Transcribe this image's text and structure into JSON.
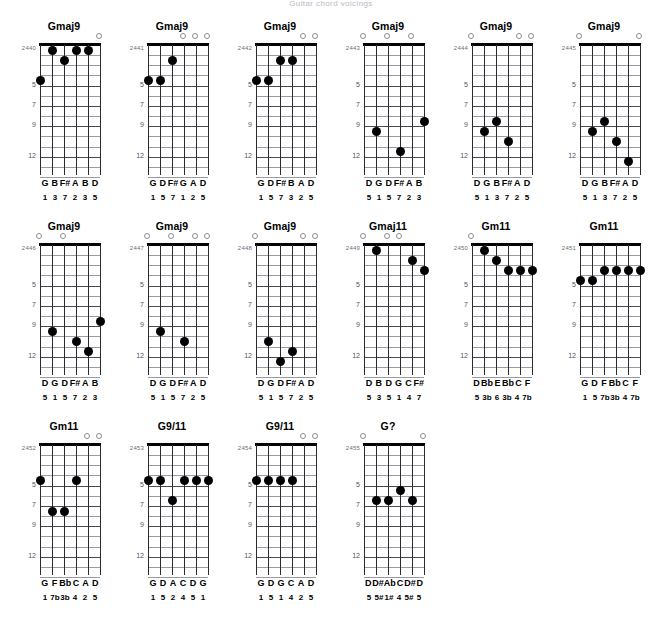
{
  "page": {
    "title": "Guitar chord voicings",
    "fret_labels": [
      "5",
      "7",
      "9",
      "12"
    ],
    "fret_label_rows": [
      4,
      6,
      8,
      11
    ],
    "num_frets": 13,
    "num_strings": 6
  },
  "chords": [
    {
      "id": "2440",
      "name": "Gmaj9",
      "open": [
        6
      ],
      "dots": [
        [
          1,
          4,
          1
        ],
        [
          2,
          1,
          3
        ],
        [
          3,
          2,
          7
        ],
        [
          4,
          1,
          2
        ],
        [
          5,
          1,
          3
        ]
      ],
      "notes": [
        "G",
        "B",
        "F#",
        "A",
        "B",
        "D"
      ],
      "degrees": [
        "1",
        "3",
        "7",
        "2",
        "3",
        "5"
      ]
    },
    {
      "id": "2441",
      "name": "Gmaj9",
      "open": [
        4,
        5,
        6
      ],
      "dots": [
        [
          1,
          4,
          1
        ],
        [
          2,
          4,
          5
        ],
        [
          3,
          2,
          7
        ]
      ],
      "notes": [
        "G",
        "D",
        "F#",
        "G",
        "A",
        "D"
      ],
      "degrees": [
        "1",
        "5",
        "7",
        "1",
        "2",
        "5"
      ]
    },
    {
      "id": "2442",
      "name": "Gmaj9",
      "open": [
        5,
        6
      ],
      "dots": [
        [
          1,
          4,
          1
        ],
        [
          2,
          4,
          5
        ],
        [
          3,
          2,
          7
        ],
        [
          4,
          2,
          3
        ]
      ],
      "notes": [
        "G",
        "D",
        "F#",
        "B",
        "A",
        "D"
      ],
      "degrees": [
        "1",
        "5",
        "7",
        "3",
        "2",
        "5"
      ]
    },
    {
      "id": "2443",
      "name": "Gmaj9",
      "open": [
        1,
        3,
        5
      ],
      "dots": [
        [
          2,
          9,
          1
        ],
        [
          4,
          11,
          7
        ],
        [
          6,
          8,
          3
        ]
      ],
      "notes": [
        "D",
        "G",
        "D",
        "F#",
        "A",
        "B"
      ],
      "degrees": [
        "5",
        "1",
        "5",
        "7",
        "2",
        "3"
      ]
    },
    {
      "id": "2444",
      "name": "Gmaj9",
      "open": [
        1,
        5,
        6
      ],
      "dots": [
        [
          2,
          9,
          1
        ],
        [
          3,
          8,
          3
        ],
        [
          4,
          10,
          7
        ]
      ],
      "notes": [
        "D",
        "G",
        "B",
        "F#",
        "A",
        "D"
      ],
      "degrees": [
        "5",
        "1",
        "3",
        "7",
        "2",
        "5"
      ]
    },
    {
      "id": "2445",
      "name": "Gmaj9",
      "open": [
        1,
        6
      ],
      "dots": [
        [
          2,
          9,
          1
        ],
        [
          3,
          8,
          3
        ],
        [
          4,
          10,
          7
        ],
        [
          5,
          12,
          2
        ]
      ],
      "notes": [
        "D",
        "G",
        "B",
        "F#",
        "A",
        "D"
      ],
      "degrees": [
        "5",
        "1",
        "3",
        "7",
        "2",
        "5"
      ]
    },
    {
      "id": "2446",
      "name": "Gmaj9",
      "open": [
        1,
        3
      ],
      "dots": [
        [
          2,
          9,
          1
        ],
        [
          4,
          10,
          7
        ],
        [
          5,
          11,
          2
        ],
        [
          6,
          8,
          3
        ]
      ],
      "notes": [
        "D",
        "G",
        "D",
        "F#",
        "A",
        "B"
      ],
      "degrees": [
        "5",
        "1",
        "5",
        "7",
        "2",
        "3"
      ]
    },
    {
      "id": "2447",
      "name": "Gmaj9",
      "open": [
        1,
        3,
        5,
        6
      ],
      "dots": [
        [
          2,
          9,
          1
        ],
        [
          4,
          10,
          7
        ]
      ],
      "notes": [
        "D",
        "G",
        "D",
        "F#",
        "A",
        "D"
      ],
      "degrees": [
        "5",
        "1",
        "5",
        "7",
        "2",
        "5"
      ]
    },
    {
      "id": "2448",
      "name": "Gmaj9",
      "open": [
        1,
        5,
        6
      ],
      "dots": [
        [
          2,
          10,
          1
        ],
        [
          3,
          12,
          5
        ],
        [
          4,
          11,
          7
        ]
      ],
      "notes": [
        "D",
        "G",
        "D",
        "F#",
        "A",
        "D"
      ],
      "degrees": [
        "5",
        "1",
        "5",
        "7",
        "2",
        "5"
      ]
    },
    {
      "id": "2449",
      "name": "Gmaj11",
      "open": [
        1,
        3,
        4
      ],
      "dots": [
        [
          2,
          1,
          3
        ],
        [
          5,
          2,
          4
        ],
        [
          6,
          3,
          7
        ]
      ],
      "notes": [
        "D",
        "B",
        "D",
        "G",
        "C",
        "F#"
      ],
      "degrees": [
        "5",
        "3",
        "5",
        "1",
        "4",
        "7"
      ]
    },
    {
      "id": "2450",
      "name": "Gm11",
      "open": [
        1
      ],
      "dots": [
        [
          2,
          1,
          3
        ],
        [
          3,
          2,
          6
        ],
        [
          4,
          3,
          3
        ],
        [
          5,
          3,
          4
        ],
        [
          6,
          3,
          7
        ]
      ],
      "notes": [
        "D",
        "Bb",
        "E",
        "Bb",
        "C",
        "F"
      ],
      "degrees": [
        "5",
        "3b",
        "6",
        "3b",
        "4",
        "7b"
      ]
    },
    {
      "id": "2451",
      "name": "Gm11",
      "open": [],
      "dots": [
        [
          1,
          4,
          1
        ],
        [
          2,
          4,
          5
        ],
        [
          3,
          3,
          7
        ],
        [
          4,
          3,
          3
        ],
        [
          5,
          3,
          4
        ],
        [
          6,
          3,
          7
        ]
      ],
      "notes": [
        "G",
        "D",
        "F",
        "Bb",
        "C",
        "F"
      ],
      "degrees": [
        "1",
        "5",
        "7b",
        "3b",
        "4",
        "7b"
      ]
    },
    {
      "id": "2452",
      "name": "Gm11",
      "open": [
        5,
        6
      ],
      "dots": [
        [
          1,
          4,
          1
        ],
        [
          2,
          7,
          7
        ],
        [
          3,
          7,
          3
        ],
        [
          4,
          4,
          4
        ]
      ],
      "notes": [
        "G",
        "F",
        "Bb",
        "C",
        "A",
        "D"
      ],
      "degrees": [
        "1",
        "7b",
        "3b",
        "4",
        "2",
        "5"
      ]
    },
    {
      "id": "2453",
      "name": "G9/11",
      "open": [],
      "dots": [
        [
          1,
          4,
          1
        ],
        [
          2,
          4,
          5
        ],
        [
          3,
          6,
          2
        ],
        [
          4,
          4,
          4
        ],
        [
          5,
          4,
          5
        ],
        [
          6,
          4,
          1
        ]
      ],
      "notes": [
        "G",
        "D",
        "A",
        "C",
        "D",
        "G"
      ],
      "degrees": [
        "1",
        "5",
        "2",
        "4",
        "5",
        "1"
      ]
    },
    {
      "id": "2454",
      "name": "G9/11",
      "open": [
        5,
        6
      ],
      "dots": [
        [
          1,
          4,
          1
        ],
        [
          2,
          4,
          5
        ],
        [
          3,
          4,
          1
        ],
        [
          4,
          4,
          4
        ]
      ],
      "notes": [
        "G",
        "D",
        "G",
        "C",
        "A",
        "D"
      ],
      "degrees": [
        "1",
        "5",
        "1",
        "4",
        "2",
        "5"
      ]
    },
    {
      "id": "2455",
      "name": "G?",
      "open": [
        1,
        6
      ],
      "dots": [
        [
          2,
          6,
          5
        ],
        [
          3,
          6,
          1
        ],
        [
          4,
          5,
          4
        ],
        [
          5,
          6,
          5
        ]
      ],
      "notes": [
        "D",
        "D#",
        "Ab",
        "C",
        "D#",
        "D"
      ],
      "degrees": [
        "5",
        "5#",
        "1#",
        "4",
        "5#",
        "5"
      ]
    }
  ],
  "chart_data": {
    "type": "table",
    "title": "Guitar chord voicings",
    "columns": [
      "id",
      "name",
      "open_strings",
      "fretted_dots",
      "notes",
      "degrees"
    ],
    "rows": [
      [
        "2440",
        "Gmaj9",
        "6",
        "s1f4 s2f1 s3f2 s4f1 s5f1",
        "G B F# A B D",
        "1 3 7 2 3 5"
      ],
      [
        "2441",
        "Gmaj9",
        "4,5,6",
        "s1f4 s2f4 s3f2",
        "G D F# G A D",
        "1 5 7 1 2 5"
      ],
      [
        "2442",
        "Gmaj9",
        "5,6",
        "s1f4 s2f4 s3f2 s4f2",
        "G D F# B A D",
        "1 5 7 3 2 5"
      ],
      [
        "2443",
        "Gmaj9",
        "1,3,5",
        "s2f9 s4f11 s6f8",
        "D G D F# A B",
        "5 1 5 7 2 3"
      ],
      [
        "2444",
        "Gmaj9",
        "1,5,6",
        "s2f9 s3f8 s4f10",
        "D G B F# A D",
        "5 1 3 7 2 5"
      ],
      [
        "2445",
        "Gmaj9",
        "1,6",
        "s2f9 s3f8 s4f10 s5f12",
        "D G B F# A D",
        "5 1 3 7 2 5"
      ],
      [
        "2446",
        "Gmaj9",
        "1,3",
        "s2f9 s4f10 s5f11 s6f8",
        "D G D F# A B",
        "5 1 5 7 2 3"
      ],
      [
        "2447",
        "Gmaj9",
        "1,3,5,6",
        "s2f9 s4f10",
        "D G D F# A D",
        "5 1 5 7 2 5"
      ],
      [
        "2448",
        "Gmaj9",
        "1,5,6",
        "s2f10 s3f12 s4f11",
        "D G D F# A D",
        "5 1 5 7 2 5"
      ],
      [
        "2449",
        "Gmaj11",
        "1,3,4",
        "s2f1 s5f2 s6f3",
        "D B D G C F#",
        "5 3 5 1 4 7"
      ],
      [
        "2450",
        "Gm11",
        "1",
        "s2f1 s3f2 s4f3 s5f3 s6f3",
        "D Bb E Bb C F",
        "5 3b 6 3b 4 7b"
      ],
      [
        "2451",
        "Gm11",
        "none",
        "s1f4 s2f4 s3f3 s4f3 s5f3 s6f3",
        "G D F Bb C F",
        "1 5 7b 3b 4 7b"
      ],
      [
        "2452",
        "Gm11",
        "5,6",
        "s1f4 s2f7 s3f7 s4f4",
        "G F Bb C A D",
        "1 7b 3b 4 2 5"
      ],
      [
        "2453",
        "G9/11",
        "none",
        "s1f4 s2f4 s3f6 s4f4 s5f4 s6f4",
        "G D A C D G",
        "1 5 2 4 5 1"
      ],
      [
        "2454",
        "G9/11",
        "5,6",
        "s1f4 s2f4 s3f4 s4f4",
        "G D G C A D",
        "1 5 1 4 2 5"
      ],
      [
        "2455",
        "G?",
        "1,6",
        "s2f6 s3f6 s4f5 s5f6",
        "D D# Ab C D# D",
        "5 5# 1# 4 5# 5"
      ]
    ]
  }
}
